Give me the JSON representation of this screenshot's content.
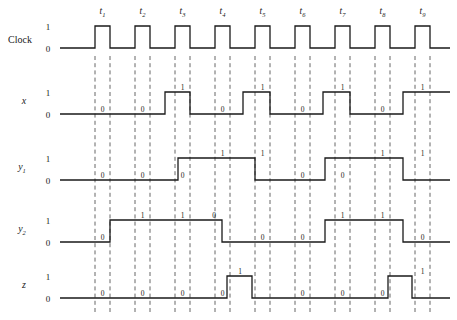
{
  "figure": {
    "kind": "digital-timing-diagram",
    "width": 457,
    "height": 320,
    "background": "#ffffff",
    "wave_color": "#1a1a1a",
    "dash_color": "#555555"
  },
  "time_axis": {
    "labels": [
      "t1",
      "t2",
      "t3",
      "t4",
      "t5",
      "t6",
      "t7",
      "t8",
      "t9"
    ],
    "label_base": [
      "t",
      "t",
      "t",
      "t",
      "t",
      "t",
      "t",
      "t",
      "t"
    ],
    "label_sub": [
      "1",
      "2",
      "3",
      "4",
      "5",
      "6",
      "7",
      "8",
      "9"
    ],
    "label_y": 14,
    "tick_centers": [
      102.5,
      142.5,
      182.5,
      222.5,
      262.5,
      302.5,
      342.5,
      382.5,
      422.5
    ]
  },
  "levels": {
    "high": "1",
    "low": "0"
  },
  "clock": {
    "name": "Clock",
    "italic": false,
    "label_x": 8,
    "label_y": 43,
    "y_high": 26,
    "y_low": 48,
    "level_label_x": 48,
    "start_x": 60,
    "end_x": 450,
    "pulses": [
      [
        95,
        110
      ],
      [
        135,
        150
      ],
      [
        175,
        190
      ],
      [
        215,
        230
      ],
      [
        255,
        270
      ],
      [
        295,
        310
      ],
      [
        335,
        350
      ],
      [
        375,
        390
      ],
      [
        415,
        430
      ]
    ]
  },
  "dash_lines": {
    "pairs": [
      [
        95,
        110
      ],
      [
        135,
        150
      ],
      [
        175,
        190
      ],
      [
        215,
        230
      ],
      [
        255,
        270
      ],
      [
        295,
        310
      ],
      [
        335,
        350
      ],
      [
        375,
        390
      ],
      [
        415,
        430
      ]
    ],
    "top": 56,
    "bottom": 312
  },
  "signals": [
    {
      "name": "x",
      "italic": true,
      "label_x": 24,
      "label_y": 104,
      "y_high": 92,
      "y_low": 114,
      "level_label_x": 48,
      "start_x": 60,
      "end_x": 450,
      "initial": 0,
      "transitions": [
        {
          "x": 165,
          "to": 1
        },
        {
          "x": 190,
          "to": 0
        },
        {
          "x": 243,
          "to": 1
        },
        {
          "x": 270,
          "to": 0
        },
        {
          "x": 323,
          "to": 1
        },
        {
          "x": 350,
          "to": 0
        },
        {
          "x": 403,
          "to": 1
        }
      ],
      "bit_marks": [
        {
          "x": 102.5,
          "value": "0",
          "level": 0
        },
        {
          "x": 142.5,
          "value": "0",
          "level": 0
        },
        {
          "x": 182.5,
          "value": "1",
          "level": 1
        },
        {
          "x": 222.5,
          "value": "0",
          "level": 0
        },
        {
          "x": 262.5,
          "value": "1",
          "level": 1
        },
        {
          "x": 302.5,
          "value": "0",
          "level": 0
        },
        {
          "x": 342.5,
          "value": "1",
          "level": 1
        },
        {
          "x": 382.5,
          "value": "0",
          "level": 0
        },
        {
          "x": 422.5,
          "value": "1",
          "level": 1
        }
      ]
    },
    {
      "name": "y1",
      "name_base": "y",
      "name_sub": "1",
      "italic": true,
      "label_x": 22,
      "label_y": 170,
      "y_high": 158,
      "y_low": 180,
      "level_label_x": 48,
      "start_x": 60,
      "end_x": 450,
      "initial": 0,
      "transitions": [
        {
          "x": 178,
          "to": 1
        },
        {
          "x": 255,
          "to": 0
        },
        {
          "x": 325,
          "to": 1
        },
        {
          "x": 403,
          "to": 0
        }
      ],
      "bit_marks": [
        {
          "x": 102.5,
          "value": "0",
          "level": 0
        },
        {
          "x": 142.5,
          "value": "0",
          "level": 0
        },
        {
          "x": 182.5,
          "value": "0",
          "level": 0
        },
        {
          "x": 222.5,
          "value": "1",
          "level": 1
        },
        {
          "x": 262.5,
          "value": "1",
          "level": 1
        },
        {
          "x": 302.5,
          "value": "0",
          "level": 0
        },
        {
          "x": 342.5,
          "value": "0",
          "level": 0
        },
        {
          "x": 382.5,
          "value": "1",
          "level": 1
        },
        {
          "x": 422.5,
          "value": "1",
          "level": 1
        }
      ]
    },
    {
      "name": "y2",
      "name_base": "y",
      "name_sub": "2",
      "italic": true,
      "label_x": 22,
      "label_y": 232,
      "y_high": 220,
      "y_low": 242,
      "level_label_x": 48,
      "start_x": 60,
      "end_x": 450,
      "initial": 0,
      "transitions": [
        {
          "x": 110,
          "to": 1
        },
        {
          "x": 222,
          "to": 0
        },
        {
          "x": 325,
          "to": 1
        },
        {
          "x": 403,
          "to": 0
        }
      ],
      "bit_marks": [
        {
          "x": 102.5,
          "value": "0",
          "level": 0
        },
        {
          "x": 142.5,
          "value": "1",
          "level": 1
        },
        {
          "x": 182.5,
          "value": "1",
          "level": 1
        },
        {
          "x": 214.0,
          "value": "0",
          "level": 1
        },
        {
          "x": 262.5,
          "value": "0",
          "level": 0
        },
        {
          "x": 302.5,
          "value": "0",
          "level": 0
        },
        {
          "x": 342.5,
          "value": "1",
          "level": 1
        },
        {
          "x": 382.5,
          "value": "1",
          "level": 1
        },
        {
          "x": 422.5,
          "value": "0",
          "level": 0
        }
      ]
    },
    {
      "name": "z",
      "italic": true,
      "label_x": 24,
      "label_y": 288,
      "y_high": 276,
      "y_low": 298,
      "level_label_x": 48,
      "start_x": 60,
      "end_x": 450,
      "initial": 0,
      "transitions": [
        {
          "x": 227,
          "to": 1
        },
        {
          "x": 252,
          "to": 0
        },
        {
          "x": 388,
          "to": 1
        },
        {
          "x": 412,
          "to": 0
        }
      ],
      "bit_marks": [
        {
          "x": 102.5,
          "value": "0",
          "level": 0
        },
        {
          "x": 142.5,
          "value": "0",
          "level": 0
        },
        {
          "x": 182.5,
          "value": "0",
          "level": 0
        },
        {
          "x": 222.5,
          "value": "0",
          "level": 0
        },
        {
          "x": 240.0,
          "value": "1",
          "level": 1
        },
        {
          "x": 302.5,
          "value": "0",
          "level": 0
        },
        {
          "x": 342.5,
          "value": "0",
          "level": 0
        },
        {
          "x": 382.5,
          "value": "0",
          "level": 0
        },
        {
          "x": 422.5,
          "value": "1",
          "level": 1
        }
      ]
    }
  ]
}
